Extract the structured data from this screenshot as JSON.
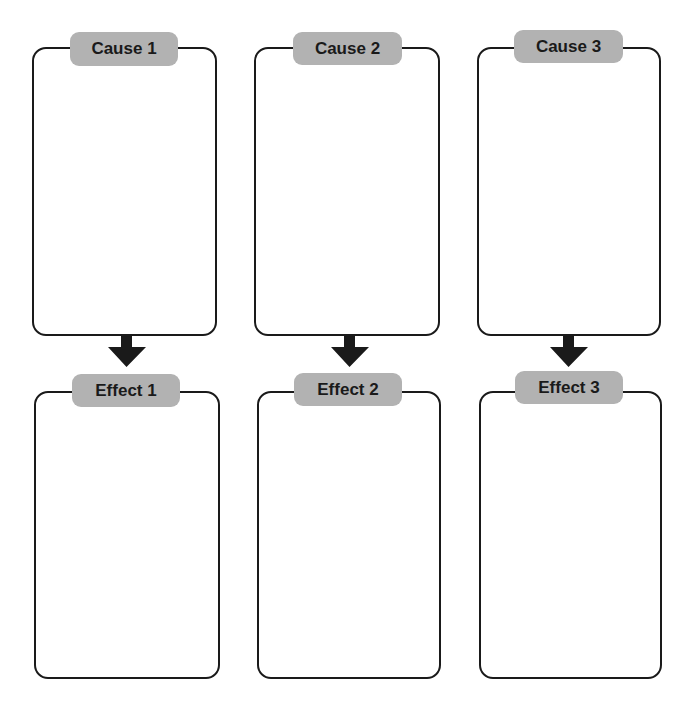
{
  "columns": [
    {
      "cause": {
        "label": "Cause 1"
      },
      "effect": {
        "label": "Effect 1"
      },
      "arrow": "down-arrow"
    },
    {
      "cause": {
        "label": "Cause 2"
      },
      "effect": {
        "label": "Effect 2"
      },
      "arrow": "down-arrow"
    },
    {
      "cause": {
        "label": "Cause 3"
      },
      "effect": {
        "label": "Effect 3"
      },
      "arrow": "down-arrow"
    }
  ],
  "colors": {
    "label_fill": "#b2b2b2",
    "border": "#1a1a1a",
    "arrow": "#1a1a1a",
    "background": "#ffffff"
  }
}
